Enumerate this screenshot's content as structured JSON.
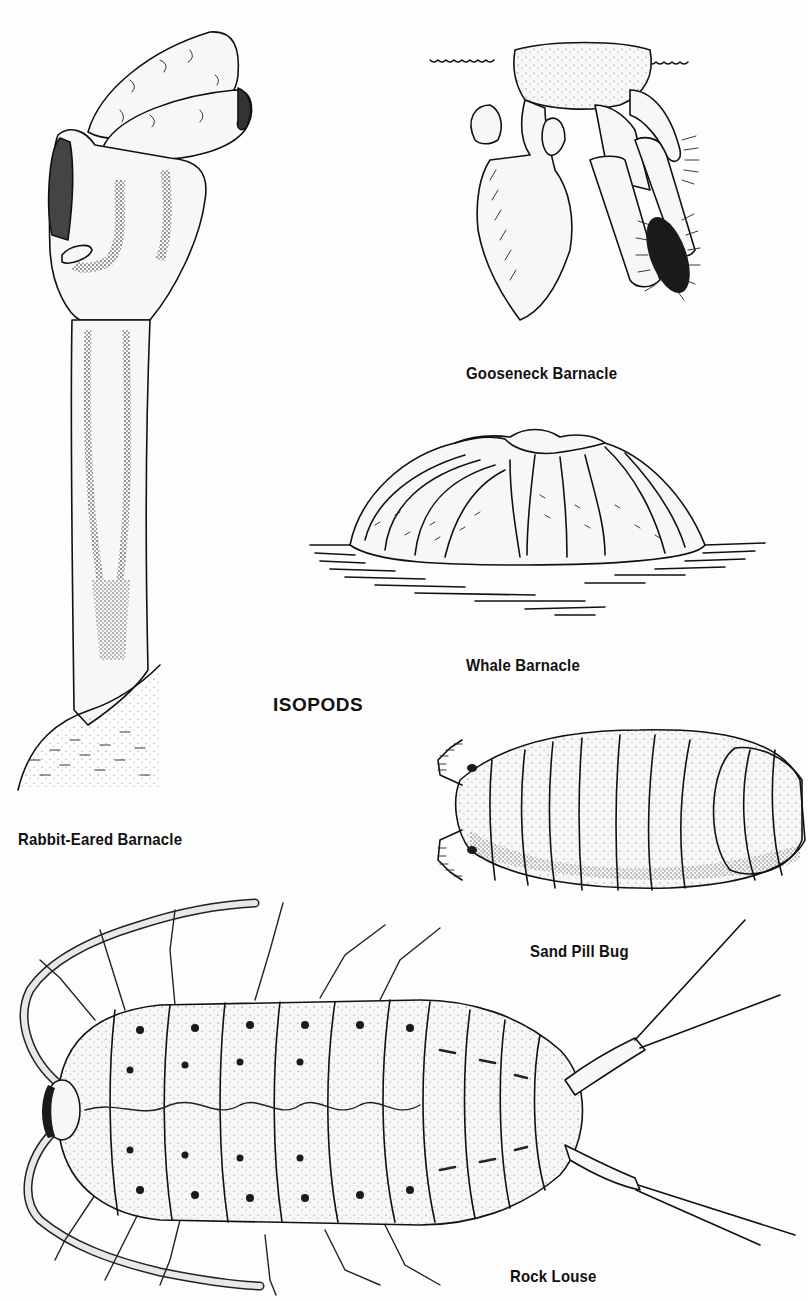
{
  "page": {
    "background": "#fdfdfd",
    "ink_color": "#111111"
  },
  "figures": {
    "rabbit_eared_barnacle": {
      "caption": "Rabbit-Eared Barnacle"
    },
    "gooseneck_barnacle": {
      "caption": "Gooseneck Barnacle"
    },
    "whale_barnacle": {
      "caption": "Whale Barnacle"
    },
    "sand_pill_bug": {
      "caption": "Sand Pill Bug"
    },
    "rock_louse": {
      "caption": "Rock Louse"
    }
  },
  "sections": {
    "isopods": {
      "heading": "ISOPODS"
    }
  }
}
